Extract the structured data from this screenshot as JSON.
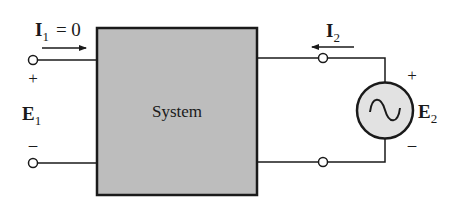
{
  "diagram": {
    "type": "two-port circuit",
    "colors": {
      "line": "#1a1a1a",
      "box_fill": "#bdbdbd",
      "source_fill": "#e2e2e2",
      "background": "#ffffff"
    },
    "system_block": {
      "label": "System"
    },
    "left_port": {
      "current_symbol": "I",
      "current_subscript": "1",
      "current_value": "= 0",
      "current_direction": "right",
      "voltage_symbol": "E",
      "voltage_subscript": "1",
      "plus": "+",
      "minus": "–"
    },
    "right_port": {
      "current_symbol": "I",
      "current_subscript": "2",
      "current_direction": "left",
      "source_symbol": "E",
      "source_subscript": "2",
      "source_type": "ac-voltage-source",
      "plus": "+",
      "minus": "–"
    }
  }
}
